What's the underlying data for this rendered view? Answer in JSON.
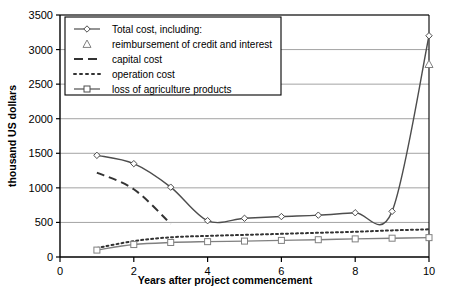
{
  "chart_data": {
    "type": "line",
    "title": "",
    "xlabel": "Years after project commencement",
    "ylabel": "thousand US dollars",
    "xlim": [
      0,
      10
    ],
    "ylim": [
      0,
      3500
    ],
    "xticks": [
      "0",
      "2",
      "4",
      "6",
      "8",
      "10"
    ],
    "xtick_values": [
      0,
      2,
      4,
      6,
      8,
      10
    ],
    "yticks": [
      "0",
      "500",
      "1000",
      "1500",
      "2000",
      "2500",
      "3000",
      "3500"
    ],
    "ytick_values": [
      0,
      500,
      1000,
      1500,
      2000,
      2500,
      3000,
      3500
    ],
    "grid": "horizontal",
    "legend_position": "top-left",
    "x": [
      1,
      2,
      3,
      4,
      5,
      6,
      7,
      8,
      9,
      10
    ],
    "series": [
      {
        "name": "Total cost, including:",
        "marker": "diamond",
        "line": "solid",
        "color": "#4d4d4d",
        "x": [
          1,
          2,
          3,
          4,
          5,
          6,
          7,
          8,
          9,
          10
        ],
        "values": [
          1470,
          1350,
          1010,
          525,
          560,
          585,
          605,
          640,
          660,
          3200
        ]
      },
      {
        "name": "reimbursement of credit and interest",
        "marker": "triangle",
        "line": "none",
        "color": "#808080",
        "x": [
          10
        ],
        "values": [
          2790
        ]
      },
      {
        "name": "capital cost",
        "marker": "none",
        "line": "dashed",
        "color": "#333333",
        "x": [
          1,
          2,
          3
        ],
        "values": [
          1220,
          980,
          480
        ]
      },
      {
        "name": "operation cost",
        "marker": "none",
        "line": "dotted",
        "color": "#333333",
        "x": [
          1,
          2,
          3,
          4,
          5,
          6,
          7,
          8,
          9,
          10
        ],
        "values": [
          130,
          230,
          285,
          305,
          320,
          335,
          350,
          365,
          385,
          400
        ]
      },
      {
        "name": "loss of agriculture products",
        "marker": "square",
        "line": "solid",
        "color": "#808080",
        "x": [
          1,
          2,
          3,
          4,
          5,
          6,
          7,
          8,
          9,
          10
        ],
        "values": [
          100,
          180,
          210,
          222,
          230,
          240,
          250,
          262,
          272,
          280
        ]
      }
    ],
    "legend": [
      {
        "label": "Total cost, including:",
        "marker": "diamond",
        "line": "solid"
      },
      {
        "label": "reimbursement of credit and interest",
        "marker": "triangle",
        "line": "none"
      },
      {
        "label": "capital cost",
        "marker": "none",
        "line": "dashed"
      },
      {
        "label": "operation cost",
        "marker": "none",
        "line": "dotted"
      },
      {
        "label": "loss of agriculture products",
        "marker": "square",
        "line": "solid"
      }
    ]
  }
}
